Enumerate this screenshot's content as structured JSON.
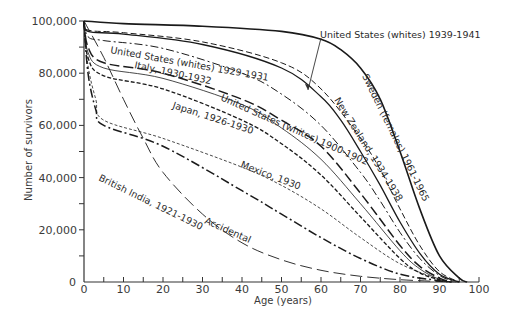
{
  "chart_data": {
    "type": "line",
    "title": "",
    "xlabel": "Age (years)",
    "ylabel": "Number of survivors",
    "xlim": [
      0,
      100
    ],
    "ylim": [
      0,
      100000
    ],
    "grid": false,
    "legend": "inline labels on curves",
    "x_ticks": [
      0,
      10,
      20,
      30,
      40,
      50,
      60,
      70,
      80,
      90,
      100
    ],
    "x_tick_labels": [
      "0",
      "10",
      "20",
      "30",
      "40",
      "50",
      "60",
      "70",
      "80",
      "90",
      "100"
    ],
    "y_ticks": [
      0,
      20000,
      40000,
      60000,
      80000,
      100000
    ],
    "y_tick_labels": [
      "0",
      "20,000",
      "40,000",
      "60,000",
      "80,000",
      "100,000"
    ],
    "series": [
      {
        "name": "Sweden (females) 1961-1965",
        "style": "solid-thick",
        "points": [
          [
            0,
            100000
          ],
          [
            10,
            99000
          ],
          [
            30,
            98000
          ],
          [
            50,
            96000
          ],
          [
            60,
            93000
          ],
          [
            65,
            89000
          ],
          [
            70,
            82000
          ],
          [
            75,
            70000
          ],
          [
            80,
            50000
          ],
          [
            85,
            28000
          ],
          [
            90,
            10000
          ],
          [
            95,
            1500
          ],
          [
            97,
            0
          ]
        ]
      },
      {
        "name": "United States (whites) 1939-1941",
        "style": "solid",
        "points": [
          [
            0,
            100000
          ],
          [
            1,
            96000
          ],
          [
            10,
            95000
          ],
          [
            30,
            91000
          ],
          [
            50,
            82000
          ],
          [
            60,
            71000
          ],
          [
            65,
            62000
          ],
          [
            70,
            50000
          ],
          [
            75,
            37000
          ],
          [
            80,
            23000
          ],
          [
            85,
            11000
          ],
          [
            90,
            3000
          ],
          [
            95,
            0
          ]
        ]
      },
      {
        "name": "New Zealand, 1934-1938",
        "style": "dashed",
        "points": [
          [
            0,
            100000
          ],
          [
            1,
            96500
          ],
          [
            10,
            95500
          ],
          [
            30,
            92000
          ],
          [
            50,
            84000
          ],
          [
            60,
            74000
          ],
          [
            70,
            55000
          ],
          [
            75,
            43000
          ],
          [
            80,
            28000
          ],
          [
            85,
            14000
          ],
          [
            90,
            4000
          ],
          [
            95,
            0
          ]
        ]
      },
      {
        "name": "United States (whites) 1929-1931",
        "style": "dash-dot",
        "points": [
          [
            0,
            100000
          ],
          [
            1,
            94000
          ],
          [
            5,
            92500
          ],
          [
            20,
            89500
          ],
          [
            40,
            80000
          ],
          [
            50,
            72000
          ],
          [
            60,
            60000
          ],
          [
            70,
            42000
          ],
          [
            75,
            31000
          ],
          [
            80,
            19000
          ],
          [
            85,
            9000
          ],
          [
            90,
            2500
          ],
          [
            94,
            0
          ]
        ]
      },
      {
        "name": "Italy, 1930-1932",
        "style": "long-dash",
        "points": [
          [
            0,
            100000
          ],
          [
            1,
            90000
          ],
          [
            5,
            84000
          ],
          [
            20,
            80000
          ],
          [
            40,
            70000
          ],
          [
            50,
            62000
          ],
          [
            60,
            52000
          ],
          [
            70,
            34000
          ],
          [
            80,
            14000
          ],
          [
            85,
            6000
          ],
          [
            90,
            1500
          ],
          [
            93,
            0
          ]
        ]
      },
      {
        "name": "United States (whites) 1900-1902",
        "style": "thin-solid",
        "points": [
          [
            0,
            100000
          ],
          [
            1,
            88000
          ],
          [
            5,
            82000
          ],
          [
            20,
            78000
          ],
          [
            40,
            68000
          ],
          [
            50,
            59000
          ],
          [
            60,
            47000
          ],
          [
            70,
            30000
          ],
          [
            80,
            12000
          ],
          [
            85,
            5000
          ],
          [
            90,
            1000
          ],
          [
            93,
            0
          ]
        ]
      },
      {
        "name": "Japan, 1926-1930",
        "style": "short-dash",
        "points": [
          [
            0,
            100000
          ],
          [
            1,
            86000
          ],
          [
            5,
            79000
          ],
          [
            20,
            74000
          ],
          [
            40,
            62000
          ],
          [
            50,
            53000
          ],
          [
            60,
            41000
          ],
          [
            70,
            25000
          ],
          [
            80,
            9000
          ],
          [
            85,
            3500
          ],
          [
            90,
            800
          ],
          [
            93,
            0
          ]
        ]
      },
      {
        "name": "Mexico, 1930",
        "style": "fine-dash",
        "points": [
          [
            0,
            100000
          ],
          [
            1,
            83000
          ],
          [
            3,
            70000
          ],
          [
            5,
            62000
          ],
          [
            20,
            55000
          ],
          [
            40,
            44000
          ],
          [
            50,
            37000
          ],
          [
            60,
            28000
          ],
          [
            70,
            17000
          ],
          [
            80,
            7000
          ],
          [
            90,
            1000
          ],
          [
            93,
            0
          ]
        ]
      },
      {
        "name": "British India, 1921-1930",
        "style": "dash-dot-thick",
        "points": [
          [
            0,
            100000
          ],
          [
            1,
            80000
          ],
          [
            3,
            66000
          ],
          [
            5,
            60000
          ],
          [
            20,
            52000
          ],
          [
            40,
            35000
          ],
          [
            50,
            26000
          ],
          [
            60,
            17000
          ],
          [
            70,
            9000
          ],
          [
            80,
            3000
          ],
          [
            90,
            500
          ],
          [
            93,
            0
          ]
        ]
      },
      {
        "name": "Accidental",
        "style": "long-dash-thin",
        "points": [
          [
            0,
            100000
          ],
          [
            5,
            86000
          ],
          [
            10,
            70000
          ],
          [
            15,
            55000
          ],
          [
            20,
            42000
          ],
          [
            30,
            26000
          ],
          [
            40,
            15000
          ],
          [
            50,
            8500
          ],
          [
            60,
            4500
          ],
          [
            70,
            2200
          ],
          [
            80,
            900
          ],
          [
            90,
            200
          ],
          [
            95,
            0
          ]
        ]
      }
    ]
  },
  "labels": {
    "sweden": "Sweden (females) 1961-1965",
    "us_1939": "United States (whites) 1939-1941",
    "new_zealand": "New Zealand, 1934-1938",
    "us_1929": "United States (whites) 1929-1931",
    "italy": "Italy, 1930-1932",
    "us_1900": "United States (whites) 1900-1902",
    "japan": "Japan, 1926-1930",
    "mexico": "Mexico, 1930",
    "british_india": "British India, 1921-1930",
    "accidental": "Accidental"
  }
}
